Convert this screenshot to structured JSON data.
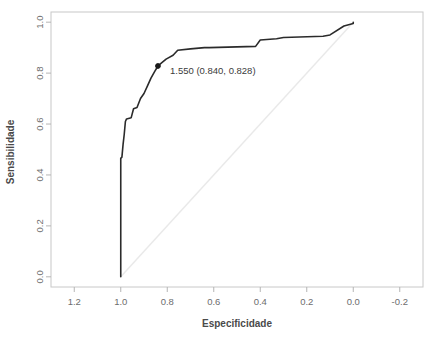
{
  "chart_data": {
    "type": "line",
    "title": "",
    "xlabel": "Especificidade",
    "ylabel": "Sensibilidade",
    "xlim": [
      1.3,
      -0.3
    ],
    "ylim": [
      -0.04,
      1.04
    ],
    "x_reversed": true,
    "grid": false,
    "legend": null,
    "x_ticks": [
      "1.2",
      "1.0",
      "0.8",
      "0.6",
      "0.4",
      "0.2",
      "0.0",
      "-0.2"
    ],
    "x_tick_values": [
      1.2,
      1.0,
      0.8,
      0.6,
      0.4,
      0.2,
      0.0,
      -0.2
    ],
    "y_ticks": [
      "0.0",
      "0.2",
      "0.4",
      "0.6",
      "0.8",
      "1.0"
    ],
    "y_tick_values": [
      0.0,
      0.2,
      0.4,
      0.6,
      0.8,
      1.0
    ],
    "series": [
      {
        "name": "roc-curve",
        "color": "#2b2b2b",
        "x": [
          1.0,
          1.0,
          0.995,
          0.99,
          0.985,
          0.98,
          0.975,
          0.955,
          0.945,
          0.93,
          0.915,
          0.9,
          0.885,
          0.87,
          0.855,
          0.84,
          0.805,
          0.775,
          0.755,
          0.7,
          0.64,
          0.62,
          0.42,
          0.4,
          0.33,
          0.3,
          0.13,
          0.1,
          0.04,
          0.0,
          0.0
        ],
        "y": [
          0.0,
          0.465,
          0.47,
          0.52,
          0.56,
          0.61,
          0.62,
          0.625,
          0.66,
          0.665,
          0.7,
          0.72,
          0.75,
          0.78,
          0.805,
          0.828,
          0.855,
          0.87,
          0.89,
          0.895,
          0.9,
          0.9,
          0.905,
          0.93,
          0.935,
          0.94,
          0.945,
          0.95,
          0.985,
          0.995,
          1.0
        ]
      },
      {
        "name": "reference-diagonal",
        "color": "#e9e9e9",
        "x": [
          1.0,
          0.0
        ],
        "y": [
          0.0,
          1.0
        ]
      }
    ],
    "annotations": [
      {
        "name": "optimal-threshold-point",
        "label": "1.550 (0.840, 0.828)",
        "threshold": "1.550",
        "specificity": 0.84,
        "sensitivity": 0.828,
        "marker": "filled-circle",
        "marker_color": "#1a1a1a"
      }
    ]
  },
  "axes": {
    "box_color": "#c8c8c8",
    "tick_color": "#b5b5b5",
    "label_color": "#6d6d6d"
  }
}
